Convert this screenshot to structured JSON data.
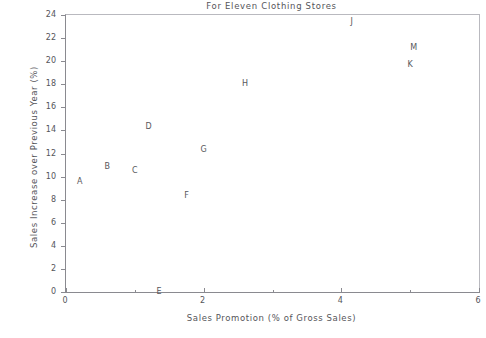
{
  "chart_data": {
    "type": "scatter",
    "title": "For Eleven Clothing Stores",
    "xlabel": "Sales Promotion (% of Gross Sales)",
    "ylabel": "Sales Increase over Previous Year (%)",
    "xlim": [
      0,
      6
    ],
    "ylim": [
      0,
      24
    ],
    "xticks": [
      0,
      1,
      2,
      3,
      4,
      5,
      6
    ],
    "xticklabels": [
      "0",
      "",
      "2",
      "",
      "4",
      "",
      "6"
    ],
    "yticks": [
      0,
      2,
      4,
      6,
      8,
      10,
      12,
      14,
      16,
      18,
      20,
      22,
      24
    ],
    "yticklabels": [
      "0",
      "2",
      "4",
      "6",
      "8",
      "10",
      "12",
      "14",
      "16",
      "18",
      "20",
      "22",
      "24"
    ],
    "grid": false,
    "legend": false,
    "marker_style": "letter-label",
    "points": [
      {
        "label": "A",
        "x": 0.2,
        "y": 9.5
      },
      {
        "label": "B",
        "x": 0.6,
        "y": 10.8
      },
      {
        "label": "C",
        "x": 1.0,
        "y": 10.5
      },
      {
        "label": "D",
        "x": 1.2,
        "y": 14.3
      },
      {
        "label": "E",
        "x": 1.35,
        "y": 0.0
      },
      {
        "label": "F",
        "x": 1.75,
        "y": 8.3
      },
      {
        "label": "G",
        "x": 2.0,
        "y": 12.3
      },
      {
        "label": "H",
        "x": 2.6,
        "y": 18.0
      },
      {
        "label": "J",
        "x": 4.15,
        "y": 23.4
      },
      {
        "label": "K",
        "x": 5.0,
        "y": 19.7
      },
      {
        "label": "M",
        "x": 5.05,
        "y": 21.1
      }
    ]
  },
  "colors": {
    "background": "#ffffff",
    "axis": "#8a8a90",
    "frame_light": "#b9b9bf",
    "text": "#55555a",
    "point_text": "#57575c"
  }
}
